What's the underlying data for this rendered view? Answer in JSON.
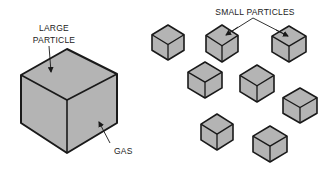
{
  "colors": {
    "cube_fill": "#b4b4b4",
    "stroke": "#1a1a1a",
    "background": "#ffffff"
  },
  "labels": {
    "large_particle_line1": "LARGE",
    "large_particle_line2": "PARTICLE",
    "gas": "GAS",
    "small_particles": "SMALL PARTICLES"
  },
  "large_cube": {
    "top": [
      67,
      49
    ],
    "left": [
      21,
      75
    ],
    "right": [
      117,
      74
    ],
    "center": [
      67,
      100
    ],
    "bottom": [
      67,
      153
    ],
    "left_bottom": [
      21,
      123
    ],
    "right_bottom": [
      117,
      123
    ]
  },
  "small_cubes": [
    {
      "id": 1,
      "cx": 168,
      "top": 25,
      "half_w": 16,
      "bottom": 60
    },
    {
      "id": 2,
      "cx": 222,
      "top": 25,
      "half_w": 16,
      "bottom": 62
    },
    {
      "id": 3,
      "cx": 289,
      "top": 26,
      "half_w": 17,
      "bottom": 62
    },
    {
      "id": 4,
      "cx": 205,
      "top": 62,
      "half_w": 17,
      "bottom": 98
    },
    {
      "id": 5,
      "cx": 257,
      "top": 65,
      "half_w": 17,
      "bottom": 102
    },
    {
      "id": 6,
      "cx": 300,
      "top": 88,
      "half_w": 17,
      "bottom": 123
    },
    {
      "id": 7,
      "cx": 217,
      "top": 114,
      "half_w": 16,
      "bottom": 150
    },
    {
      "id": 8,
      "cx": 270,
      "top": 126,
      "half_w": 17,
      "bottom": 162
    }
  ]
}
